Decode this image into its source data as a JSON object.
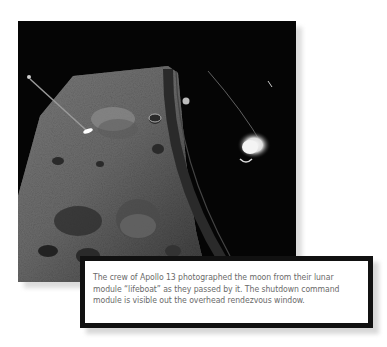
{
  "photo": {
    "subject": "Moon surface viewed from Apollo 13 lunar module window",
    "alt": "Apollo 13 photograph of the lunar surface with the command module visible through the window"
  },
  "caption": {
    "text": "The crew of Apollo 13 photographed the moon from their lunar module “lifeboat” as they passed by it. The shutdown command module is visible out the overhead rendezvous window."
  },
  "colors": {
    "frame_border": "#111111",
    "caption_text": "#6a6a6a",
    "shadow": "#d8d8d8"
  }
}
